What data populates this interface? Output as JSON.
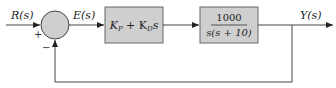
{
  "diagram": {
    "type": "feedback-control-block-diagram",
    "input_label": "R(s)",
    "error_label": "E(s)",
    "output_label": "Y(s)",
    "summing_junction": {
      "plus_sign": "+",
      "minus_sign": "−"
    },
    "controller": {
      "label_parts": [
        "K",
        "P",
        " + K",
        "D",
        "s"
      ]
    },
    "plant": {
      "numerator": "1000",
      "denominator": "s(s + 10)"
    },
    "colors": {
      "block_fill": "#cfcfcf",
      "line": "#444444",
      "junction_fill": "#cfcfcf"
    }
  }
}
